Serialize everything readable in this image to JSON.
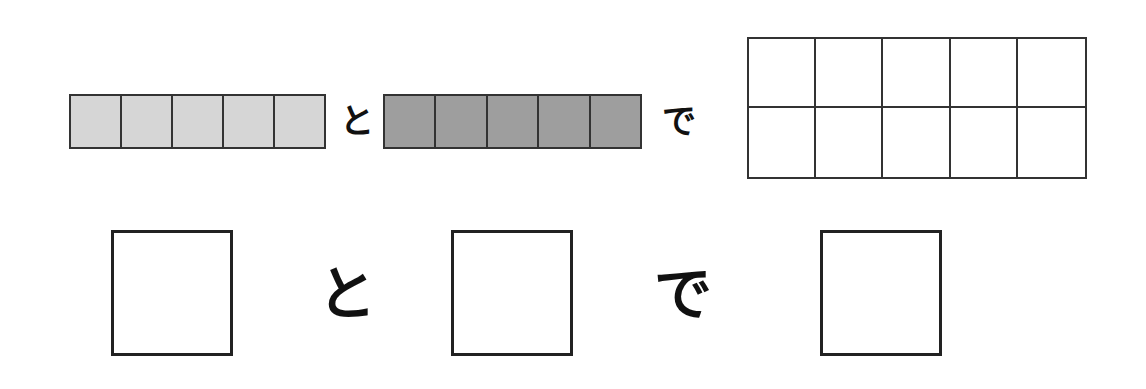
{
  "top_row": {
    "light_strip": {
      "cells": 5,
      "color": "#d6d6d6"
    },
    "connector_1": "と",
    "dark_strip": {
      "cells": 5,
      "color": "#9e9e9e"
    },
    "connector_2": "で",
    "result_grid": {
      "rows": 2,
      "cols": 5,
      "color": "#ffffff"
    }
  },
  "bottom_row": {
    "box_1": "",
    "connector_1": "と",
    "box_2": "",
    "connector_2": "で",
    "box_3": ""
  }
}
